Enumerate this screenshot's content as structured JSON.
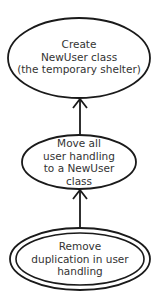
{
  "diagram": {
    "type": "mikado-graph",
    "colors": {
      "stroke": "#1a1a1a",
      "text": "#333333",
      "background": "#ffffff"
    },
    "nodes": [
      {
        "id": "create-newuser",
        "lines": [
          "Create",
          "NewUser class",
          "(the temporary shelter)"
        ],
        "shape": "ellipse"
      },
      {
        "id": "move-user-handling",
        "lines": [
          "Move all",
          "user handling",
          "to a NewUser",
          "class"
        ],
        "shape": "ellipse"
      },
      {
        "id": "remove-duplication",
        "lines": [
          "Remove",
          "duplication in user",
          "handling"
        ],
        "shape": "double-ellipse",
        "is_goal": true
      }
    ],
    "edges": [
      {
        "from": "remove-duplication",
        "to": "move-user-handling"
      },
      {
        "from": "move-user-handling",
        "to": "create-newuser"
      }
    ]
  }
}
